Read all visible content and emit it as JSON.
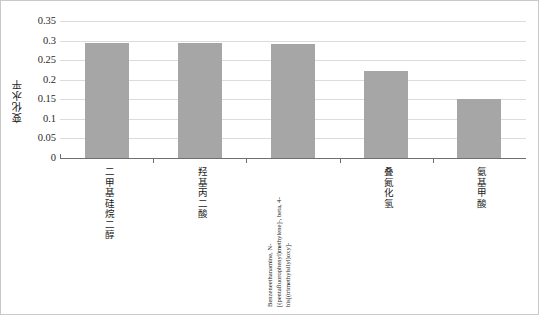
{
  "chart_data": {
    "type": "bar",
    "title": "",
    "xlabel": "",
    "ylabel": "变化水平",
    "ylim": [
      0,
      0.35
    ],
    "yticks": [
      "0",
      "0.05",
      "0.1",
      "0.15",
      "0.2",
      "0.25",
      "0.3",
      "0.35"
    ],
    "ytick_values": [
      0,
      0.05,
      0.1,
      0.15,
      0.2,
      0.25,
      0.3,
      0.35
    ],
    "grid": true,
    "legend": "none",
    "bar_color": "#a6a6a6",
    "categories": [
      "二甲基硅烷二醇",
      "羟基丙二酸",
      "Benzeneethanamine, N-[(pentafluorophenyl)methylene]-, beta, 4-bis[(trimethylsilyl)oxy]-",
      "叠氮化氢",
      "氨基甲酸"
    ],
    "values": [
      0.295,
      0.294,
      0.291,
      0.222,
      0.15
    ]
  },
  "colors": {
    "bar": "#a6a6a6",
    "gridline": "#dcdcdc",
    "axis": "#6f6f6f",
    "border": "#c9c9c9",
    "text": "#1a1a1a"
  }
}
